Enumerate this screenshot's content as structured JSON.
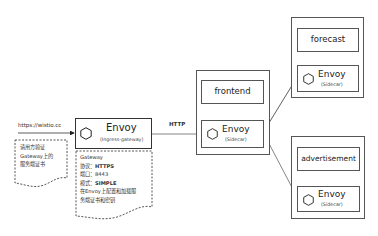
{
  "diagram": {
    "client": {
      "url": "https://wistio.cc",
      "note_lines": [
        "请用方验证",
        "Gateway上的",
        "服务端证书"
      ]
    },
    "ingress": {
      "title": "Envoy",
      "subtitle": "(Ingress-gateway)",
      "note": {
        "line1": "Gateway",
        "protocol_label": "协议：",
        "protocol_value": "HTTPS",
        "port_label": "端口：",
        "port_value": "8443",
        "mode_label": "模式：",
        "mode_value": "SIMPLE",
        "line5": "在Envoy上配置和加载服",
        "line6": "务端证书和密钥"
      }
    },
    "edge_label": "HTTP",
    "services": [
      {
        "name": "frontend",
        "envoy_title": "Envoy",
        "envoy_subtitle": "(Sidecar)"
      },
      {
        "name": "forecast",
        "envoy_title": "Envoy",
        "envoy_subtitle": "(Sidecar)"
      },
      {
        "name": "advertisement",
        "envoy_title": "Envoy",
        "envoy_subtitle": "(Sidecar)"
      }
    ],
    "colors": {
      "line": "#333333",
      "border": "#555555",
      "background": "#ffffff"
    }
  }
}
